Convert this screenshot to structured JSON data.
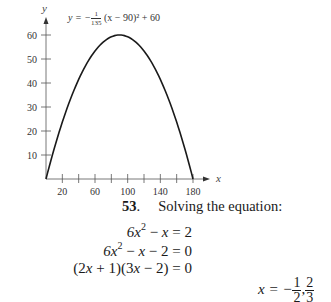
{
  "chart_data": {
    "type": "line",
    "title": "",
    "annotation": "y = -1/135 (x - 90)^2 + 60",
    "xlabel": "x",
    "ylabel": "y",
    "xlim": [
      0,
      180
    ],
    "ylim": [
      0,
      60
    ],
    "x_tick_labels": [
      "20",
      "60",
      "100",
      "140",
      "180"
    ],
    "x_ticks": [
      20,
      40,
      60,
      80,
      100,
      120,
      140,
      160,
      180
    ],
    "y_tick_labels": [
      "10",
      "20",
      "30",
      "40",
      "50",
      "60"
    ],
    "grid": false,
    "legend": "none",
    "series": [
      {
        "name": "y = -1/135 (x - 90)^2 + 60",
        "x": [
          0,
          20,
          40,
          60,
          80,
          90,
          100,
          120,
          140,
          160,
          180
        ],
        "y": [
          0,
          23.7,
          41.5,
          53.3,
          59.3,
          60,
          59.3,
          53.3,
          41.5,
          23.7,
          0
        ]
      }
    ]
  },
  "formula": {
    "lhs": "y = −",
    "frac_num": "1",
    "frac_den": "135",
    "rest": "(x − 90)² + 60"
  },
  "problem": {
    "number": "53",
    "number_suffix": ".",
    "title": "Solving the equation:",
    "steps": [
      "6x² − x = 2",
      "6x² − x − 2 = 0",
      "(2x + 1)(3x − 2) = 0"
    ],
    "solution_prefix": "x = −",
    "solution_frac1_num": "1",
    "solution_frac1_den": "2",
    "solution_sep": ",",
    "solution_frac2_num": "2",
    "solution_frac2_den": "3"
  }
}
